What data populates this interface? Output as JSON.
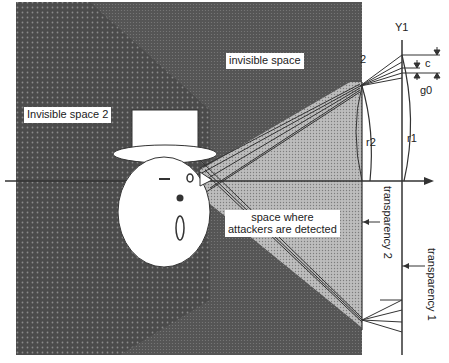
{
  "diagram": {
    "labels": {
      "invisible_space": "invisible space",
      "invisible_space_2": "Invisible space 2",
      "detected_space_line1": "space where",
      "detected_space_line2": "attackers are detected",
      "transparency_1": "transparency 1",
      "transparency_2": "transparency 2",
      "axis_y1": "Y1",
      "r1": "r1",
      "r2": "r2",
      "c": "c",
      "g0": "g0",
      "num_2": "2"
    },
    "colors": {
      "dark_region": "#4a4a4a",
      "dotted_region": "#9a9a9a",
      "line": "#333333",
      "background": "#ffffff"
    }
  }
}
